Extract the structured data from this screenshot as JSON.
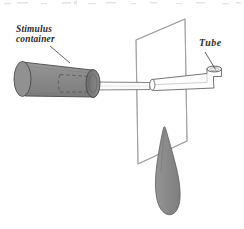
{
  "figure": {
    "domain": "diagram",
    "type": "scientific-apparatus-line-drawing",
    "canvas": {
      "width": 244,
      "height": 229
    },
    "background_color": "#ffffff",
    "labels": [
      {
        "name": "stimulus-container",
        "line1": "Stimulus",
        "line2": "container",
        "style": "italic-serif-bold",
        "color": "#2b2b2b",
        "position": {
          "x": 16,
          "y": 24
        },
        "leader_line": {
          "from": [
            50,
            46
          ],
          "to": [
            70,
            63
          ]
        }
      },
      {
        "name": "tube",
        "text": "Tube",
        "style": "italic-serif-bold",
        "color": "#2b2b2b",
        "position": {
          "x": 199,
          "y": 38
        },
        "leader_line": {
          "from": [
            205,
            52
          ],
          "to": [
            215,
            70
          ]
        }
      }
    ],
    "parts": {
      "stimulus_container": {
        "label": "Stimulus container",
        "shape": "cylinder",
        "fill_color": "#8c8c8c",
        "cap_fill_color": "#7a7a7a",
        "stroke_color": "#4a4a4a",
        "has_dashed_interior": true,
        "dashed_stroke_color": "#4f4f4f"
      },
      "plate": {
        "label": "Plate",
        "shape": "parallelogram-perspective-panel",
        "fill_color": "#ffffff",
        "stroke_color": "#8d8d8d",
        "corners": [
          [
            136,
            40
          ],
          [
            185,
            19
          ],
          [
            187,
            141
          ],
          [
            138,
            164
          ]
        ]
      },
      "tube": {
        "label": "Tube",
        "shape": "l-bend-tube",
        "fill_color": "#fdfdfd",
        "stroke_color": "#6d6d6d",
        "opening": "ellipse-top-right"
      },
      "leaf": {
        "label": "Leaf",
        "shape": "elongated-leaf-blade",
        "fill_color": "#8a8a8a",
        "stroke_color": "#5d5d5d"
      }
    }
  }
}
